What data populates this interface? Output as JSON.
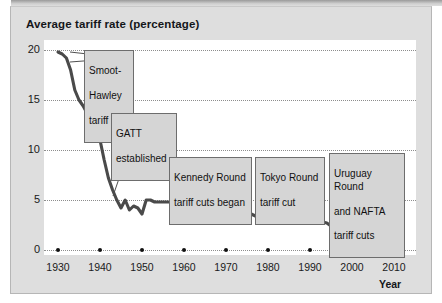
{
  "chart_data": {
    "type": "line",
    "title": "Average tariff rate (percentage)",
    "xlabel": "Year",
    "ylabel": "",
    "xlim": [
      1930,
      2010
    ],
    "ylim": [
      0,
      20
    ],
    "grid": true,
    "legend": "none",
    "xticks": [
      "1930",
      "1940",
      "1950",
      "1960",
      "1970",
      "1980",
      "1990",
      "2000",
      "2010"
    ],
    "yticks": [
      "0",
      "5",
      "10",
      "15",
      "20"
    ],
    "series": [
      {
        "name": "Average tariff rate",
        "color": "#4a4a4a",
        "x": [
          1930,
          1931,
          1932,
          1933,
          1934,
          1935,
          1936,
          1937,
          1938,
          1939,
          1940,
          1941,
          1942,
          1943,
          1944,
          1945,
          1946,
          1947,
          1948,
          1949,
          1950,
          1951,
          1952,
          1953,
          1954,
          1955,
          1956,
          1957,
          1958,
          1959,
          1960,
          1961,
          1962,
          1963,
          1964,
          1965,
          1966,
          1967,
          1968,
          1969,
          1970,
          1971,
          1972,
          1973,
          1974,
          1975,
          1976,
          1977,
          1978,
          1979,
          1980,
          1981,
          1982,
          1983,
          1984,
          1985,
          1986,
          1987,
          1988,
          1989,
          1990,
          1991,
          1992,
          1993,
          1994,
          1995,
          1996,
          1997,
          1998,
          1999,
          2000,
          2001,
          2002,
          2003,
          2004,
          2005
        ],
        "y": [
          19.8,
          19.6,
          19.2,
          18.0,
          16.0,
          15.0,
          14.4,
          13.6,
          12.8,
          12.0,
          11.0,
          9.0,
          7.2,
          6.0,
          5.0,
          4.2,
          5.0,
          4.0,
          4.4,
          4.2,
          3.6,
          5.0,
          5.0,
          4.8,
          4.8,
          4.8,
          4.8,
          4.8,
          4.9,
          4.8,
          5.0,
          5.0,
          5.0,
          5.1,
          5.1,
          5.1,
          5.1,
          5.0,
          5.2,
          5.2,
          5.0,
          4.8,
          4.2,
          3.5,
          3.6,
          3.5,
          3.6,
          3.4,
          3.5,
          3.4,
          3.5,
          3.6,
          3.5,
          3.6,
          3.7,
          3.6,
          3.6,
          3.6,
          3.5,
          3.4,
          3.3,
          3.2,
          3.0,
          2.8,
          2.7,
          2.4,
          2.2,
          2.0,
          1.8,
          1.6,
          1.5,
          1.4,
          1.3,
          1.2,
          1.1,
          1.0
        ]
      }
    ],
    "annotations": [
      {
        "id": "smoot-hawley",
        "lines": [
          "Smoot-",
          "Hawley",
          "tariff"
        ],
        "target_year": 1931,
        "target_value": 19.6
      },
      {
        "id": "gatt-established",
        "lines": [
          "GATT",
          "established"
        ],
        "target_year": 1947,
        "target_value": 4.5
      },
      {
        "id": "kennedy-round",
        "lines": [
          "Kennedy Round",
          "tariff cuts began"
        ],
        "target_year": 1968,
        "target_value": 5.1
      },
      {
        "id": "tokyo-round",
        "lines": [
          "Tokyo Round",
          "tariff cut"
        ],
        "target_year": 1979,
        "target_value": 3.5
      },
      {
        "id": "uruguay-nafta",
        "lines": [
          "Uruguay Round",
          "and NAFTA",
          "tariff cuts"
        ],
        "target_year": 1994,
        "target_value": 2.7
      }
    ]
  },
  "chart": {
    "title": "Average tariff rate (percentage)",
    "axis_year_label": "Year",
    "yticks": [
      {
        "label": "20"
      },
      {
        "label": "15"
      },
      {
        "label": "10"
      },
      {
        "label": "5"
      },
      {
        "label": "0"
      }
    ],
    "xticks": [
      {
        "label": "1930"
      },
      {
        "label": "1940"
      },
      {
        "label": "1950"
      },
      {
        "label": "1960"
      },
      {
        "label": "1970"
      },
      {
        "label": "1980"
      },
      {
        "label": "1990"
      },
      {
        "label": "2000"
      },
      {
        "label": "2010"
      }
    ],
    "annotations": [
      {
        "l0": "Smoot-",
        "l1": "Hawley",
        "l2": "tariff"
      },
      {
        "l0": "GATT",
        "l1": "established",
        "l2": ""
      },
      {
        "l0": "Kennedy Round",
        "l1": "tariff cuts began",
        "l2": ""
      },
      {
        "l0": "Tokyo Round",
        "l1": "tariff cut",
        "l2": ""
      },
      {
        "l0": "Uruguay Round",
        "l1": "and NAFTA",
        "l2": "tariff cuts"
      }
    ]
  }
}
